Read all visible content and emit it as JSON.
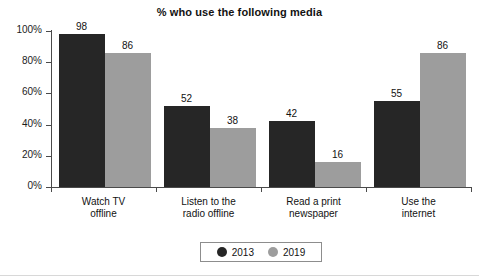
{
  "chart_data": {
    "type": "bar",
    "title": "% who use the following media",
    "xlabel": "",
    "ylabel": "",
    "ylim": [
      0,
      100
    ],
    "ytick_labels": [
      "0%",
      "20%",
      "40%",
      "60%",
      "80%",
      "100%"
    ],
    "ytick_values": [
      0,
      20,
      40,
      60,
      80,
      100
    ],
    "grid": false,
    "legend_position": "bottom-center",
    "categories": [
      "Watch TV offline",
      "Listen to the radio offline",
      "Read a print newspaper",
      "Use the internet"
    ],
    "category_lines": [
      [
        "Watch TV",
        "offline"
      ],
      [
        "Listen to the",
        "radio offline"
      ],
      [
        "Read a print",
        "newspaper"
      ],
      [
        "Use the",
        "internet"
      ]
    ],
    "series": [
      {
        "name": "2013",
        "color": "#262626",
        "values": [
          98,
          52,
          42,
          55
        ]
      },
      {
        "name": "2019",
        "color": "#9d9d9d",
        "values": [
          86,
          38,
          16,
          86
        ]
      }
    ]
  }
}
